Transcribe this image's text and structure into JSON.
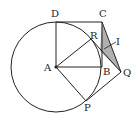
{
  "figure": {
    "labels": {
      "D": "D",
      "C": "C",
      "R": "R",
      "I": "I",
      "A": "A",
      "B": "B",
      "Q": "Q",
      "P": "P"
    },
    "colors": {
      "stroke": "#222222",
      "shade": "#b0b0b0"
    }
  }
}
